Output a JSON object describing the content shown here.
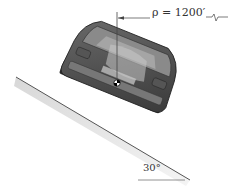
{
  "figure": {
    "radius_label": "ρ = 1200′",
    "angle_label": "30°",
    "bank_angle_deg": 30,
    "radius_ft": 1200
  }
}
